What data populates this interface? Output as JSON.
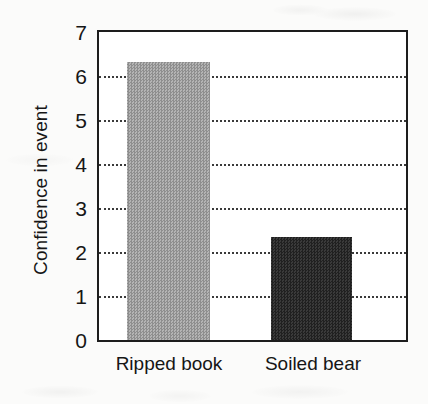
{
  "chart_data": {
    "type": "bar",
    "title": "",
    "subtitle": "",
    "xlabel": "",
    "ylabel": "Confidence in event",
    "categories": [
      "Ripped book",
      "Soiled bear"
    ],
    "values": [
      6.32,
      2.35
    ],
    "series": [
      {
        "name": "Confidence in event",
        "values": [
          6.32,
          2.35
        ]
      }
    ],
    "bar_colors": [
      "#a2a2a2",
      "#2b2b2b"
    ],
    "ylim": [
      0,
      7
    ],
    "ytick_labels": [
      "0",
      "1",
      "2",
      "3",
      "4",
      "5",
      "6",
      "7"
    ],
    "ytick_values": [
      0,
      1,
      2,
      3,
      4,
      5,
      6,
      7
    ],
    "gridline_values": [
      1,
      2,
      3,
      4,
      5,
      6
    ],
    "grid": true,
    "grid_style": "dotted",
    "legend": false,
    "legend_position": "none",
    "frame": true,
    "annotations": []
  },
  "figure": {
    "background_color": "#fbfbfa",
    "axis_color": "#1d1d1d",
    "text_color": "#161616"
  }
}
